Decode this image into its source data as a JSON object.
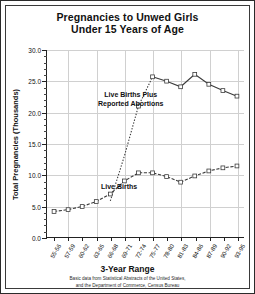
{
  "chart_data": {
    "type": "line",
    "title": "Pregnancies to Unwed Girls Under 15 Years of Age",
    "title_line1": "Pregnancies to Unwed Girls",
    "title_line2": "Under 15 Years of Age",
    "xlabel": "3-Year Range",
    "ylabel": "Total Pregnancies (Thousands)",
    "ylim": [
      0.0,
      30.0
    ],
    "yticks": [
      0.0,
      5.0,
      10.0,
      15.0,
      20.0,
      25.0,
      30.0
    ],
    "ytick_labels": [
      "0.0",
      "5.0",
      "10.0",
      "15.0",
      "20.0",
      "25.0",
      "30.0"
    ],
    "grid": true,
    "legend_position": "inline-annotation",
    "categories": [
      "55-56",
      "57-59",
      "60-62",
      "63-65",
      "66-68",
      "69-71",
      "72-74",
      "75-77",
      "78-80",
      "81-83",
      "84-86",
      "87-89",
      "90-92",
      "93-95"
    ],
    "series": [
      {
        "name": "Live Births Plus Reported Abortions",
        "style": "dotted-then-solid-with-square-markers",
        "values": [
          null,
          null,
          null,
          null,
          5.8,
          13.0,
          21.0,
          25.7,
          25.0,
          24.1,
          26.1,
          24.5,
          23.5,
          22.6
        ]
      },
      {
        "name": "Live Births",
        "style": "dashed-with-square-markers",
        "values": [
          4.1,
          4.4,
          4.9,
          5.7,
          6.9,
          9.0,
          10.3,
          10.3,
          9.7,
          8.8,
          9.8,
          10.6,
          11.1,
          11.4
        ]
      }
    ],
    "annotations": [
      {
        "text_line1": "Live Births Plus",
        "text_line2": "Reported Abortions"
      },
      {
        "text_line1": "Live Births",
        "text_line2": ""
      }
    ],
    "source_note_line1": "Basic data from  Statistical Abstracts of the United States,",
    "source_note_line2": "and the Department of Commerce, Census Bureau"
  }
}
